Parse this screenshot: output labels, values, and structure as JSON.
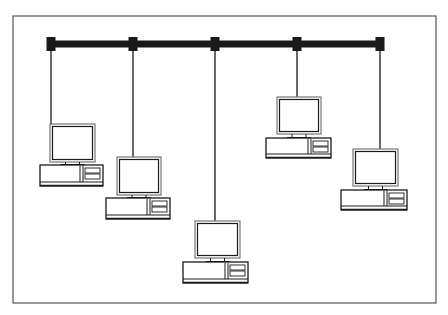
{
  "diagram": {
    "type": "bus-network-topology",
    "colors": {
      "line": "#1a1a1a",
      "frame": "#555555",
      "background": "#ffffff",
      "monitor_border": "#777777"
    },
    "frame": {
      "x": 13,
      "y": 16,
      "w": 423,
      "h": 287
    },
    "backbone": {
      "x1": 47,
      "x2": 384,
      "y": 44,
      "thickness": 7
    },
    "nodes": [
      {
        "id": "workstation-1",
        "tap_x": 51,
        "monitor": {
          "x": 50,
          "y": 124,
          "w": 45,
          "h": 38
        },
        "base": {
          "x": 40,
          "y": 165,
          "w": 63,
          "h": 21
        }
      },
      {
        "id": "workstation-2",
        "tap_x": 133,
        "monitor": {
          "x": 117,
          "y": 157,
          "w": 44,
          "h": 38
        },
        "base": {
          "x": 106,
          "y": 198,
          "w": 64,
          "h": 21
        }
      },
      {
        "id": "workstation-3",
        "tap_x": 215,
        "monitor": {
          "x": 195,
          "y": 221,
          "w": 45,
          "h": 37
        },
        "base": {
          "x": 183,
          "y": 262,
          "w": 65,
          "h": 21
        }
      },
      {
        "id": "workstation-4",
        "tap_x": 297,
        "monitor": {
          "x": 277,
          "y": 97,
          "w": 44,
          "h": 37
        },
        "base": {
          "x": 266,
          "y": 138,
          "w": 65,
          "h": 20
        }
      },
      {
        "id": "workstation-5",
        "tap_x": 380,
        "monitor": {
          "x": 353,
          "y": 149,
          "w": 45,
          "h": 37
        },
        "base": {
          "x": 341,
          "y": 190,
          "w": 66,
          "h": 20
        }
      }
    ]
  }
}
